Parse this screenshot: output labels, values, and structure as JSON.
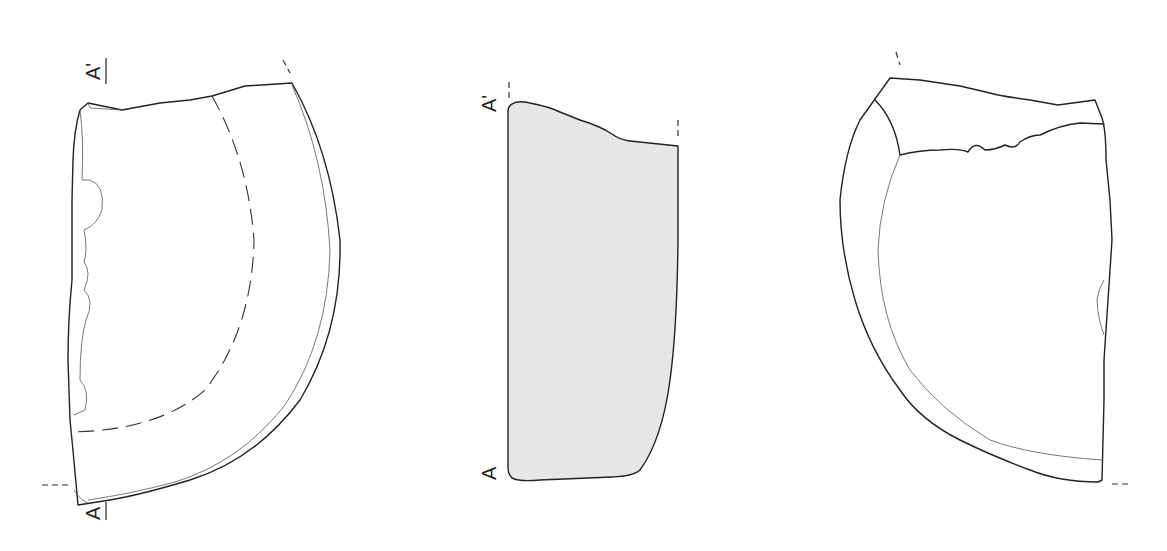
{
  "figure": {
    "type": "archaeological-sherd-drawing",
    "views": [
      {
        "name": "exterior-view",
        "position": "left"
      },
      {
        "name": "section-profile",
        "position": "center",
        "fill": "#e6e6e6"
      },
      {
        "name": "interior-view",
        "position": "right"
      }
    ],
    "labels": {
      "left_top": "A'",
      "left_bottom": "A",
      "center_top": "A'",
      "center_bottom": "A"
    },
    "colors": {
      "line": "#222222",
      "section_fill": "#e6e6e6",
      "background": "#ffffff"
    }
  }
}
